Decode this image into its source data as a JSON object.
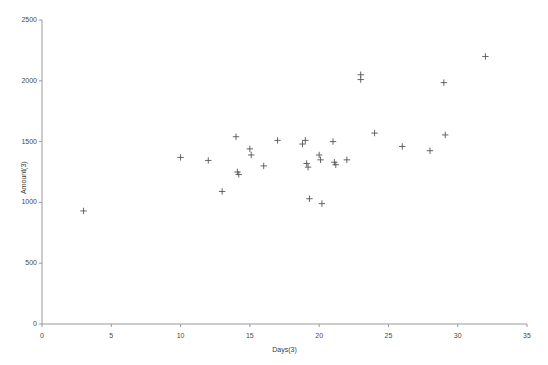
{
  "chart_data": {
    "type": "scatter",
    "title": "",
    "xlabel": "Days(3)",
    "ylabel": "Amount(3)",
    "xlim": [
      0,
      35
    ],
    "ylim": [
      0,
      2500
    ],
    "xticks": [
      0,
      5,
      10,
      15,
      20,
      25,
      30,
      35
    ],
    "yticks": [
      0,
      500,
      1000,
      1500,
      2000,
      2500
    ],
    "xtick_labels": [
      "0",
      "5",
      "10",
      "15",
      "20",
      "25",
      "30",
      "35"
    ],
    "ytick_labels": [
      "0",
      "500",
      "1000",
      "1500",
      "2000",
      "2500"
    ],
    "grid": false,
    "legend": null,
    "marker": "plus",
    "marker_color": "#555555",
    "axis_color": "#999999",
    "series": [
      {
        "name": "Amount vs Days",
        "points": [
          [
            3.0,
            930
          ],
          [
            10.0,
            1370
          ],
          [
            12.0,
            1345
          ],
          [
            13.0,
            1090
          ],
          [
            14.0,
            1540
          ],
          [
            14.1,
            1250
          ],
          [
            14.2,
            1230
          ],
          [
            15.0,
            1440
          ],
          [
            15.1,
            1390
          ],
          [
            16.0,
            1300
          ],
          [
            17.0,
            1510
          ],
          [
            18.8,
            1480
          ],
          [
            19.0,
            1510
          ],
          [
            19.1,
            1320
          ],
          [
            19.2,
            1290
          ],
          [
            19.3,
            1030
          ],
          [
            20.0,
            1390
          ],
          [
            20.1,
            1350
          ],
          [
            20.2,
            990
          ],
          [
            21.0,
            1500
          ],
          [
            21.1,
            1330
          ],
          [
            21.2,
            1310
          ],
          [
            22.0,
            1350
          ],
          [
            23.0,
            2010
          ],
          [
            23.0,
            2050
          ],
          [
            24.0,
            1570
          ],
          [
            26.0,
            1460
          ],
          [
            28.0,
            1425
          ],
          [
            29.0,
            1985
          ],
          [
            29.1,
            1555
          ],
          [
            32.0,
            2200
          ]
        ]
      }
    ]
  },
  "axes_geometry": {
    "left_px": 42,
    "right_px": 527,
    "bottom_px": 324,
    "top_px": 20
  }
}
